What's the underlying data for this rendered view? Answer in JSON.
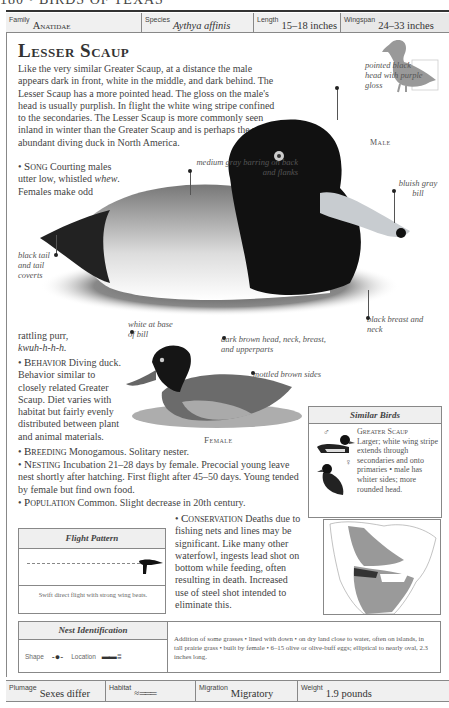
{
  "running_head": "180 • BIRDS OF TEXAS",
  "infobar": {
    "family_label": "Family",
    "family_value": "Anatidae",
    "species_label": "Species",
    "species_value": "Aythya affinis",
    "length_label": "Length",
    "length_value": "15–18 inches",
    "wingspan_label": "Wingspan",
    "wingspan_value": "24–33 inches"
  },
  "title": "Lesser Scaup",
  "intro": "Like the very similar Greater Scaup, at a distance the male appears dark in front, white in the middle, and dark behind. The Lesser Scaup has a more pointed head. The gloss on the male's head is usually purplish. In flight the white wing stripe confined to the secondaries. The Lesser Scaup is more commonly seen inland in winter than the Greater Scaup and is perhaps the most abundant diving duck in North America.",
  "male_label": "Male",
  "female_label": "Female",
  "callouts": {
    "head": "pointed black head with purple gloss",
    "back": "medium gray barring on back and flanks",
    "bill": "bluish gray bill",
    "tail": "black tail and tail coverts",
    "breast": "black breast and neck",
    "female_bill": "white at base of bill",
    "female_head": "dark brown head, neck, breast, and upperparts",
    "female_sides": "mottled brown sides"
  },
  "sections": {
    "song_label": "Song",
    "song_text_a": "Courting males utter low, whistled",
    "song_whew": "whew",
    "song_text_b": ". Females make odd",
    "song_text_c": "rattling purr,",
    "song_call": "kwuh-h-h-h.",
    "behavior_label": "Behavior",
    "behavior_text": "Diving duck. Behavior similar to closely related Greater Scaup. Diet varies with habitat but fairly evenly distributed between plant and animal materials.",
    "breeding_label": "Breeding",
    "breeding_text": "Monogamous. Solitary nester.",
    "nesting_label": "Nesting",
    "nesting_text": "Incubation 21–28 days by female. Precocial young leave nest shortly after hatching. First flight after 45–50 days. Young tended by female but find own food.",
    "population_label": "Population",
    "population_text": "Common. Slight decrease in 20th century.",
    "conservation_label": "Conservation",
    "conservation_text": "Deaths due to fishing nets and lines may be significant. Like many other waterfowl, ingests lead shot on bottom while feeding, often resulting in death. Increased use of steel shot intended to eliminate this."
  },
  "similar_birds": {
    "title": "Similar Birds",
    "name": "Greater Scaup",
    "description": "Larger; white wing stripe extends through secondaries and onto primaries • male has whiter sides; more rounded head.",
    "male_symbol": "♂",
    "female_symbol": "♀"
  },
  "flight_pattern": {
    "title": "Flight Pattern",
    "description": "Swift direct flight with strong wing beats."
  },
  "nest_identification": {
    "title": "Nest Identification",
    "shape_label": "Shape",
    "location_label": "Location",
    "description": "Addition of some grasses • lined with down • on dry land close to water, often on islands, in tall prairie grass • built by female • 6–15 olive or olive-buff eggs; elliptical to nearly oval, 2.3 inches long."
  },
  "footer": {
    "plumage_label": "Plumage",
    "plumage_value": "Sexes differ",
    "habitat_label": "Habitat",
    "migration_label": "Migration",
    "migration_value": "Migratory",
    "weight_label": "Weight",
    "weight_value": "1.9 pounds"
  }
}
